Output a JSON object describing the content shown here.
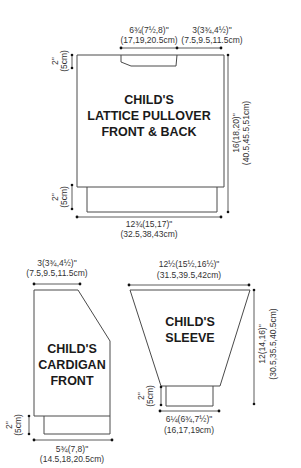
{
  "pieces": {
    "pullover": {
      "title_lines": [
        "CHILD'S",
        "LATTICE PULLOVER",
        "FRONT & BACK"
      ],
      "neck_width": {
        "imperial": "6¾(7½,8)\"",
        "metric": "(17,19,20.5cm)"
      },
      "shoulder_width": {
        "imperial": "3(3¾,4½)\"",
        "metric": "(7.5,9.5,11.5cm)"
      },
      "armhole_depth": {
        "imperial": "2\"",
        "metric": "(5cm)"
      },
      "length": {
        "imperial": "16(18,20)\"",
        "metric": "(40.5,45.5,51cm)"
      },
      "ribbing_depth": {
        "imperial": "2\"",
        "metric": "(5cm)"
      },
      "width": {
        "imperial": "12¾(15,17)\"",
        "metric": "(32.5,38,43cm)"
      }
    },
    "cardigan": {
      "title_lines": [
        "CHILD'S",
        "CARDIGAN",
        "FRONT"
      ],
      "shoulder_width": {
        "imperial": "3(3¾,4½)\"",
        "metric": "(7.5,9.5,11.5cm)"
      },
      "ribbing_depth": {
        "imperial": "2\"",
        "metric": "(5cm)"
      },
      "width": {
        "imperial": "5¾(7,8)\"",
        "metric": "(14.5,18,20.5cm)"
      }
    },
    "sleeve": {
      "title_lines": [
        "CHILD'S",
        "SLEEVE"
      ],
      "top_width": {
        "imperial": "12½(15½,16½)\"",
        "metric": "(31.5,39.5,42cm)"
      },
      "length": {
        "imperial": "12(14,16)\"",
        "metric": "(30.5,35.5,40.5cm)"
      },
      "cuff_depth": {
        "imperial": "2\"",
        "metric": "(5cm)"
      },
      "cuff_width": {
        "imperial": "6¼(6¾,7½)\"",
        "metric": "(16,17,19cm)"
      }
    }
  }
}
